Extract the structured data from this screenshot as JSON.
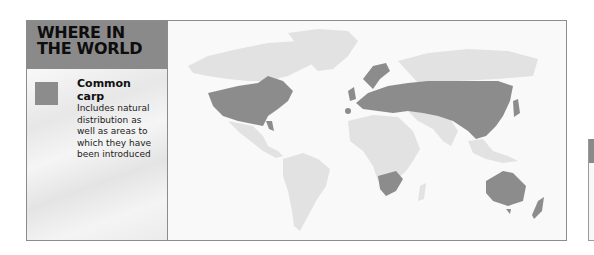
{
  "header": {
    "title": "WHERE IN\nTHE WORLD"
  },
  "legend": {
    "swatch_color": "#8c8c8c",
    "title": "Common carp",
    "description": "Includes natural distribution as well as areas to which they have been introduced"
  },
  "map": {
    "type": "world-distribution",
    "highlighted_regions": [
      "United States",
      "Southern Canada",
      "Europe",
      "Russia",
      "Central Asia",
      "China",
      "Japan",
      "South Africa",
      "Australia",
      "New Zealand"
    ],
    "colors": {
      "highlight": "#8c8c8c",
      "land": "#e2e2e2",
      "ocean": "#f9f9f9"
    }
  }
}
